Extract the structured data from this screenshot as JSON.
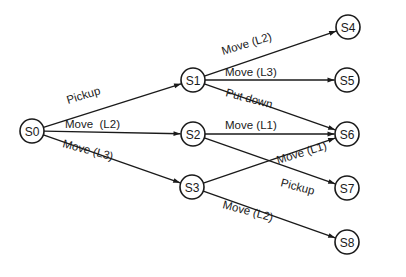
{
  "diagram": {
    "type": "state-transition-tree",
    "colors": {
      "stroke": "#1a1a1a",
      "background": "#ffffff"
    },
    "node_radius": 12,
    "nodes": [
      {
        "id": "S0",
        "label": "S0",
        "x": 32,
        "y": 131
      },
      {
        "id": "S1",
        "label": "S1",
        "x": 193,
        "y": 80
      },
      {
        "id": "S2",
        "label": "S2",
        "x": 193,
        "y": 134
      },
      {
        "id": "S3",
        "label": "S3",
        "x": 192,
        "y": 187
      },
      {
        "id": "S4",
        "label": "S4",
        "x": 348,
        "y": 27
      },
      {
        "id": "S5",
        "label": "S5",
        "x": 347,
        "y": 80
      },
      {
        "id": "S6",
        "label": "S6",
        "x": 347,
        "y": 134
      },
      {
        "id": "S7",
        "label": "S7",
        "x": 347,
        "y": 188
      },
      {
        "id": "S8",
        "label": "S8",
        "x": 347,
        "y": 242
      }
    ],
    "edges": [
      {
        "from": "S0",
        "to": "S1",
        "label": "Pickup",
        "lx": 68,
        "ly": 104,
        "angle": -17
      },
      {
        "from": "S0",
        "to": "S2",
        "label": "Move  (L2)",
        "lx": 65,
        "ly": 128,
        "angle": 0
      },
      {
        "from": "S0",
        "to": "S3",
        "label": "Move (L3)",
        "lx": 62,
        "ly": 147,
        "angle": 15
      },
      {
        "from": "S1",
        "to": "S4",
        "label": "Move (L2)",
        "lx": 223,
        "ly": 55,
        "angle": -17
      },
      {
        "from": "S1",
        "to": "S5",
        "label": "Move (L3)",
        "lx": 225,
        "ly": 76,
        "angle": 0
      },
      {
        "from": "S1",
        "to": "S6",
        "label": "Put down",
        "lx": 225,
        "ly": 96,
        "angle": 15
      },
      {
        "from": "S2",
        "to": "S6",
        "label": "Move (L1)",
        "lx": 225,
        "ly": 129,
        "angle": 0
      },
      {
        "from": "S2",
        "to": "S7",
        "label": "Pickup",
        "lx": 280,
        "ly": 186,
        "angle": 15
      },
      {
        "from": "S3",
        "to": "S6",
        "label": "Move (L1)",
        "lx": 278,
        "ly": 164,
        "angle": -17
      },
      {
        "from": "S3",
        "to": "S8",
        "label": "Move (L2)",
        "lx": 222,
        "ly": 208,
        "angle": 15
      }
    ]
  }
}
